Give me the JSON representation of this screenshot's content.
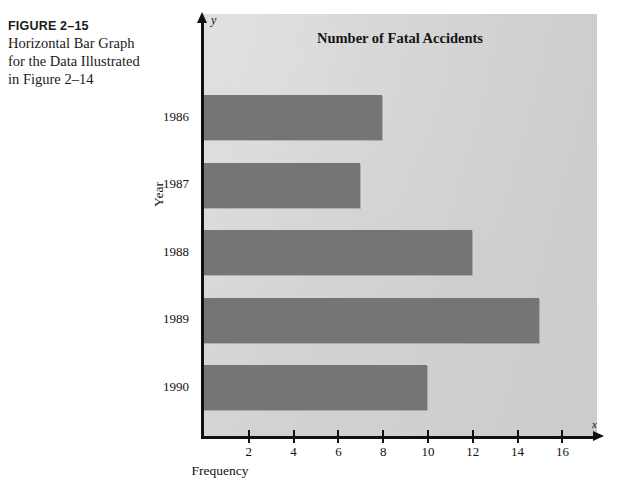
{
  "caption": {
    "figure_number": "FIGURE 2–15",
    "line1": "Horizontal Bar Graph",
    "line2": "for the Data Illustrated",
    "line3": "in Figure 2–14"
  },
  "axis_symbols": {
    "y": "y",
    "x": "x"
  },
  "colors": {
    "bar_fill": "#757575",
    "plot_background": "#d2d2d2",
    "axis": "#111111",
    "page_background": "#ffffff"
  },
  "chart_data": {
    "type": "bar",
    "orientation": "horizontal",
    "title": "Number of Fatal Accidents",
    "xlabel": "Frequency",
    "ylabel": "Year",
    "categories": [
      "1986",
      "1987",
      "1988",
      "1989",
      "1990"
    ],
    "values": [
      8,
      7,
      12,
      15,
      10
    ],
    "xlim": [
      0,
      17.5
    ],
    "xticks": [
      2,
      4,
      6,
      8,
      10,
      12,
      14,
      16
    ],
    "xtick_labels": [
      "2",
      "4",
      "6",
      "8",
      "10",
      "12",
      "14",
      "16"
    ],
    "grid": false,
    "legend": null,
    "series": [
      {
        "name": "Number of Fatal Accidents",
        "values": [
          8,
          7,
          12,
          15,
          10
        ]
      }
    ]
  }
}
